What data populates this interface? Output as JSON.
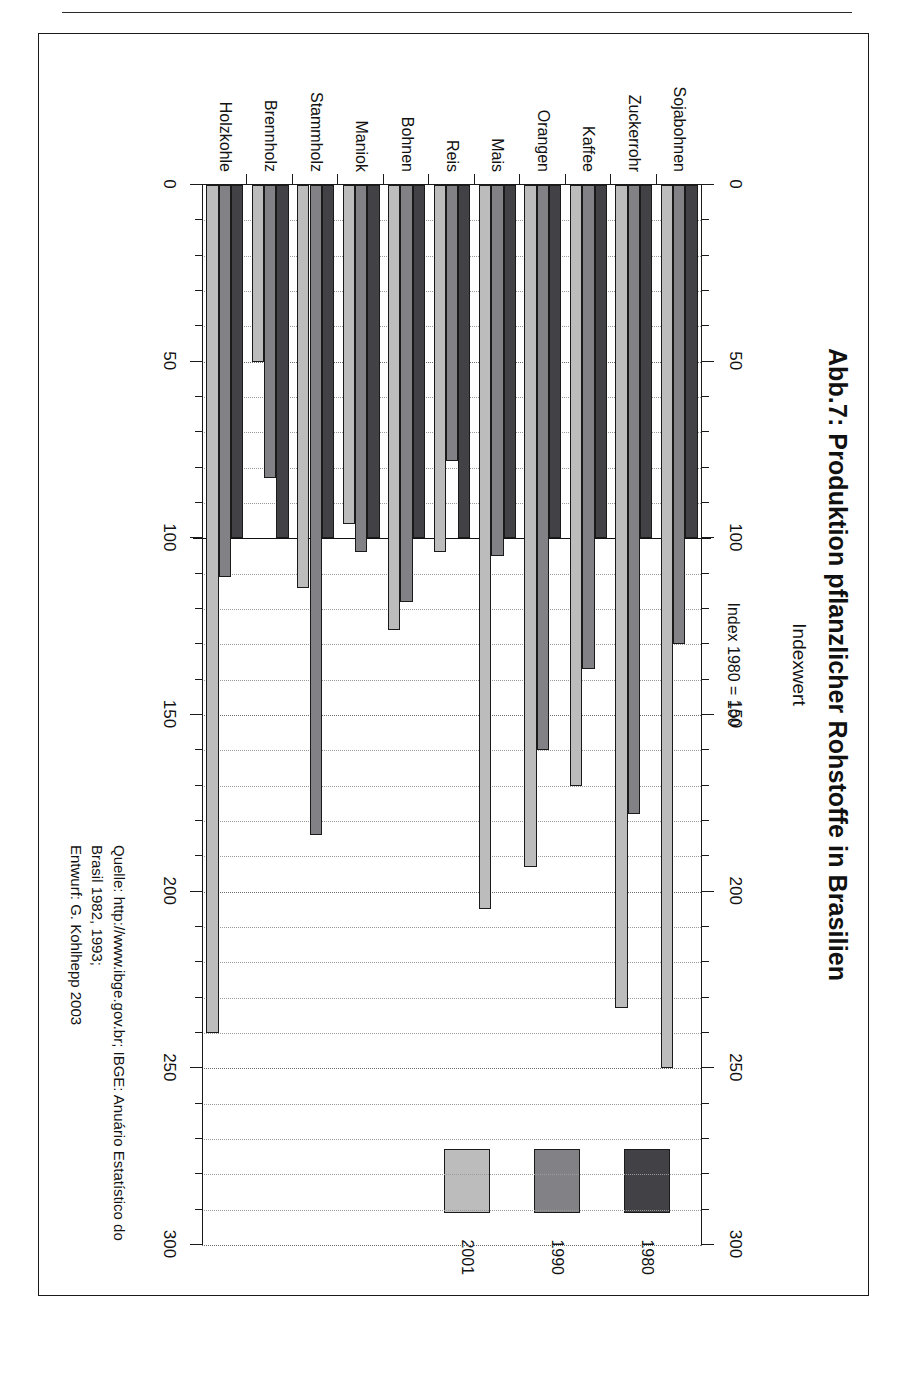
{
  "page": {
    "header_text": ""
  },
  "figure": {
    "title": "Abb.7: Produktion pflanzlicher Rohstoffe in Brasilien",
    "subtitle": "Index 1980 = 100",
    "source_line_1": "Quelle: http://www.ibge.gov.br; IBGE: Anuário Estatístico do Brasil 1982, 1993;",
    "source_line_2": "Entwurf: G. Kohlhepp 2003"
  },
  "legend": {
    "items": [
      {
        "label": "1980",
        "color": "#424246"
      },
      {
        "label": "1990",
        "color": "#828286"
      },
      {
        "label": "2001",
        "color": "#bcbcbc"
      }
    ]
  },
  "chart_data": {
    "type": "bar",
    "orientation": "horizontal",
    "title": "Abb.7: Produktion pflanzlicher Rohstoffe in Brasilien",
    "subtitle": "Index 1980 = 100",
    "xlabel": "Indexwert",
    "ylabel": "",
    "xlim": [
      0,
      300
    ],
    "xticks": [
      0,
      50,
      100,
      150,
      200,
      250,
      300
    ],
    "xtick_labels": [
      "0",
      "50",
      "100",
      "150",
      "200",
      "250",
      "300"
    ],
    "minor_tick_step": 10,
    "grid": true,
    "grid_style": "dotted vertical",
    "reference_line": 100,
    "axes_shown": [
      "top",
      "bottom"
    ],
    "legend_position": "left-outside",
    "categories": [
      "Sojabohnen",
      "Zuckerrohr",
      "Kaffee",
      "Orangen",
      "Mais",
      "Reis",
      "Bohnen",
      "Maniok",
      "Stammholz",
      "Brennholz",
      "Holzkohle"
    ],
    "series": [
      {
        "name": "1980",
        "color": "#424246",
        "values": [
          100,
          100,
          100,
          100,
          100,
          100,
          100,
          100,
          100,
          100,
          100
        ]
      },
      {
        "name": "1990",
        "color": "#828286",
        "values": [
          130,
          178,
          137,
          160,
          105,
          78,
          118,
          104,
          184,
          83,
          111
        ]
      },
      {
        "name": "2001",
        "color": "#bcbcbc",
        "values": [
          250,
          233,
          170,
          193,
          205,
          104,
          126,
          96,
          114,
          50,
          240
        ]
      }
    ]
  }
}
